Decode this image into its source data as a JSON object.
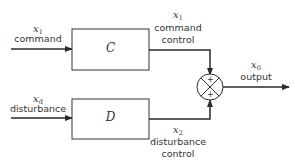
{
  "diagram": {
    "type": "block-diagram",
    "blocks": [
      {
        "id": "C",
        "label": "C"
      },
      {
        "id": "D",
        "label": "D"
      }
    ],
    "summing_junction": {
      "signs": [
        "+",
        "+"
      ]
    },
    "signals": {
      "command_input": {
        "var": "x",
        "sub": "1",
        "label": "command"
      },
      "disturbance_input": {
        "var": "x",
        "sub": "d",
        "label": "disturbance"
      },
      "command_control": {
        "var": "x",
        "sub": "1",
        "label_line1": "command",
        "label_line2": "control"
      },
      "disturbance_control": {
        "var": "x",
        "sub": "2",
        "label_line1": "disturbance",
        "label_line2": "control"
      },
      "output": {
        "var": "x",
        "sub": "0",
        "label": "output"
      }
    }
  },
  "colors": {
    "line": "#2a2a2a",
    "background": "#ffffff"
  }
}
